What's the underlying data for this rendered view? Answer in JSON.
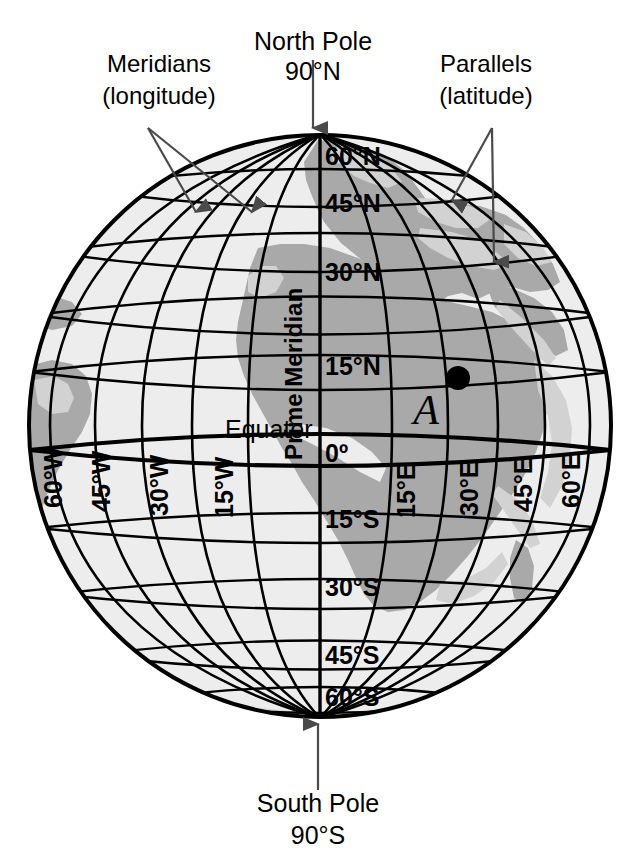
{
  "figure": {
    "kind": "globe-graticule-diagram",
    "background_color": "#ffffff"
  },
  "colors": {
    "ocean": "#ededed",
    "land": "#a9a9a9",
    "land_light": "#d2d2d2",
    "outline": "#000000",
    "grid": "#000000",
    "arrow": "#4a4a4a",
    "point": "#000000"
  },
  "poles": {
    "north": {
      "name_line1": "North Pole",
      "name_line2": "90°N"
    },
    "south": {
      "name_line1": "South Pole",
      "name_line2": "90°S"
    }
  },
  "annotations": {
    "meridians": {
      "line1": "Meridians",
      "line2": "(longitude)"
    },
    "parallels": {
      "line1": "Parallels",
      "line2": "(latitude)"
    }
  },
  "reference_lines": {
    "prime_meridian": "Prime Meridian",
    "equator": "Equator",
    "equator_value": "0º"
  },
  "latitude_labels": [
    {
      "text": "60°N",
      "value": 60
    },
    {
      "text": "45°N",
      "value": 45
    },
    {
      "text": "30°N",
      "value": 30
    },
    {
      "text": "15°N",
      "value": 15
    },
    {
      "text": "15°S",
      "value": -15
    },
    {
      "text": "30°S",
      "value": -30
    },
    {
      "text": "45°S",
      "value": -45
    },
    {
      "text": "60°S",
      "value": -60
    }
  ],
  "longitude_labels": [
    {
      "text": "60°W",
      "value": -60
    },
    {
      "text": "45°W",
      "value": -45
    },
    {
      "text": "30°W",
      "value": -30
    },
    {
      "text": "15°W",
      "value": -15
    },
    {
      "text": "15°E",
      "value": 15
    },
    {
      "text": "30°E",
      "value": 30
    },
    {
      "text": "45°E",
      "value": 45
    },
    {
      "text": "60°E",
      "value": 60
    }
  ],
  "marked_point": {
    "label": "A",
    "latitude": "15°N",
    "longitude": "30°E"
  }
}
